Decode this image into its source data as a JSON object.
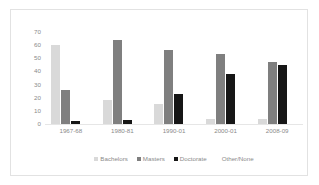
{
  "chart_data": {
    "type": "bar",
    "title": "",
    "subtitle": "",
    "xlabel": "",
    "ylabel": "",
    "categories": [
      "1967-68",
      "1980-81",
      "1990-01",
      "2000-01",
      "2008-09"
    ],
    "series": [
      {
        "name": "Bachelors",
        "color": "#d9d9d9",
        "values": [
          60,
          18,
          15,
          4,
          4
        ]
      },
      {
        "name": "Masters",
        "color": "#7f7f7f",
        "values": [
          26,
          64,
          56,
          53,
          47
        ]
      },
      {
        "name": "Doctorate",
        "color": "#161616",
        "values": [
          2,
          3,
          23,
          38,
          45
        ]
      },
      {
        "name": "Other/None",
        "color": "#ffffff",
        "values": [
          0,
          0,
          0,
          0,
          0
        ]
      }
    ],
    "ylim": [
      0,
      70
    ],
    "yticks": [
      "70",
      "60",
      "50",
      "40",
      "30",
      "20",
      "10",
      "0"
    ],
    "ytick_values": [
      70,
      60,
      50,
      40,
      30,
      20,
      10,
      0
    ],
    "grid": false,
    "legend_position": "bottom",
    "legend_entries": [
      "Bachelors",
      "Masters",
      "Doctorate",
      "Other/None"
    ],
    "annotations": []
  },
  "frame": {
    "border_color": "#e2e2e2",
    "background_color": "#ffffff",
    "axis_text_color": "#8a8a8a"
  }
}
